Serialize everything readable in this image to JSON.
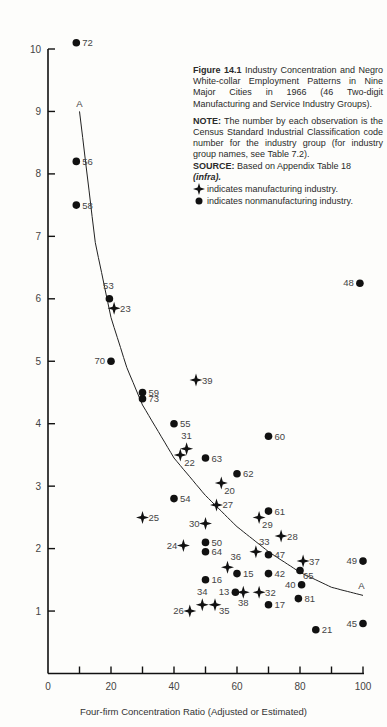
{
  "figure": {
    "number_label": "Figure 14.1",
    "title": "Industry Concentration and Negro White-collar Employment Patterns in Nine Major Cities in 1966 (46 Two-digit Manufacturing and Service Industry Groups).",
    "note_label": "NOTE:",
    "note_text": "The number by each observation is the Census Standard Industrial Classification code number for the industry group (for industry group names, see Table 7.2).",
    "source_label": "SOURCE:",
    "source_text": "Based on Appendix Table 18",
    "source_infra": "(infra).",
    "legend": [
      {
        "icon": "diamond-star-icon",
        "text": "indicates manufacturing industry."
      },
      {
        "icon": "filled-circle-icon",
        "text": "indicates nonmanufacturing industry."
      }
    ]
  },
  "chart_data": {
    "type": "scatter",
    "title": "Industry Concentration and Negro White-collar Employment Patterns in Nine Major Cities in 1966",
    "xlabel": "Four-firm Concentration Ratio (Adjusted or Estimated)",
    "ylabel": "",
    "xlim": [
      0,
      100
    ],
    "ylim": [
      0,
      10
    ],
    "x_ticks": [
      0,
      20,
      40,
      60,
      80,
      100
    ],
    "y_ticks": [
      1,
      2,
      3,
      4,
      5,
      6,
      7,
      8,
      9,
      10
    ],
    "grid": false,
    "legend_position": "upper right (in caption block)",
    "curve": {
      "label": "A",
      "description": "fitted decreasing hyperbolic curve",
      "points": [
        [
          10,
          9.0
        ],
        [
          15,
          6.9
        ],
        [
          20,
          5.7
        ],
        [
          25,
          4.9
        ],
        [
          30,
          4.3
        ],
        [
          40,
          3.45
        ],
        [
          50,
          2.85
        ],
        [
          60,
          2.35
        ],
        [
          70,
          1.95
        ],
        [
          80,
          1.62
        ],
        [
          90,
          1.38
        ],
        [
          100,
          1.25
        ]
      ]
    },
    "series": [
      {
        "name": "Manufacturing industry",
        "marker": "four-point star",
        "points": [
          {
            "code": "23",
            "x": 21,
            "y": 5.85
          },
          {
            "code": "39",
            "x": 47,
            "y": 4.7
          },
          {
            "code": "31",
            "x": 44,
            "y": 3.6
          },
          {
            "code": "22",
            "x": 42,
            "y": 3.5
          },
          {
            "code": "20",
            "x": 55,
            "y": 3.05
          },
          {
            "code": "27",
            "x": 53.5,
            "y": 2.7
          },
          {
            "code": "25",
            "x": 30,
            "y": 2.5
          },
          {
            "code": "29",
            "x": 67,
            "y": 2.5
          },
          {
            "code": "30",
            "x": 50,
            "y": 2.4
          },
          {
            "code": "28",
            "x": 74,
            "y": 2.2
          },
          {
            "code": "24",
            "x": 43,
            "y": 2.05
          },
          {
            "code": "33",
            "x": 66,
            "y": 1.95
          },
          {
            "code": "36",
            "x": 57,
            "y": 1.7
          },
          {
            "code": "37",
            "x": 81,
            "y": 1.8
          },
          {
            "code": "38",
            "x": 62,
            "y": 1.3
          },
          {
            "code": "32",
            "x": 67,
            "y": 1.3
          },
          {
            "code": "34",
            "x": 49,
            "y": 1.1
          },
          {
            "code": "35",
            "x": 53,
            "y": 1.1
          },
          {
            "code": "26",
            "x": 45,
            "y": 1.0
          }
        ]
      },
      {
        "name": "Nonmanufacturing industry",
        "marker": "filled circle",
        "points": [
          {
            "code": "72",
            "x": 9,
            "y": 10.1
          },
          {
            "code": "56",
            "x": 9,
            "y": 8.2
          },
          {
            "code": "58",
            "x": 9,
            "y": 7.5
          },
          {
            "code": "53",
            "x": 19.5,
            "y": 6.0
          },
          {
            "code": "70",
            "x": 20,
            "y": 5.0
          },
          {
            "code": "59",
            "x": 30,
            "y": 4.5
          },
          {
            "code": "73",
            "x": 30,
            "y": 4.4
          },
          {
            "code": "55",
            "x": 40,
            "y": 4.0
          },
          {
            "code": "63",
            "x": 50,
            "y": 3.45
          },
          {
            "code": "60",
            "x": 70,
            "y": 3.8
          },
          {
            "code": "62",
            "x": 60,
            "y": 3.2
          },
          {
            "code": "54",
            "x": 40,
            "y": 2.8
          },
          {
            "code": "61",
            "x": 70,
            "y": 2.6
          },
          {
            "code": "50",
            "x": 50,
            "y": 2.1
          },
          {
            "code": "64",
            "x": 50,
            "y": 1.95
          },
          {
            "code": "47",
            "x": 70,
            "y": 1.9
          },
          {
            "code": "49",
            "x": 100,
            "y": 1.8
          },
          {
            "code": "65",
            "x": 80,
            "y": 1.65
          },
          {
            "code": "15",
            "x": 60,
            "y": 1.6
          },
          {
            "code": "42",
            "x": 70,
            "y": 1.6
          },
          {
            "code": "16",
            "x": 50,
            "y": 1.5
          },
          {
            "code": "40",
            "x": 80.5,
            "y": 1.42
          },
          {
            "code": "13",
            "x": 59.5,
            "y": 1.3
          },
          {
            "code": "81",
            "x": 79.5,
            "y": 1.2
          },
          {
            "code": "17",
            "x": 70,
            "y": 1.1
          },
          {
            "code": "21",
            "x": 85,
            "y": 0.7
          },
          {
            "code": "45",
            "x": 100,
            "y": 0.8
          },
          {
            "code": "48",
            "x": 99,
            "y": 6.25
          }
        ]
      }
    ]
  },
  "labels": {
    "curve_label_top": "A",
    "curve_label_bottom": "A",
    "xlabel": "Four-firm Concentration Ratio (Adjusted or Estimated)"
  },
  "colors": {
    "ink": "#111111",
    "paper": "#fdfdfb",
    "text": "#333333"
  }
}
